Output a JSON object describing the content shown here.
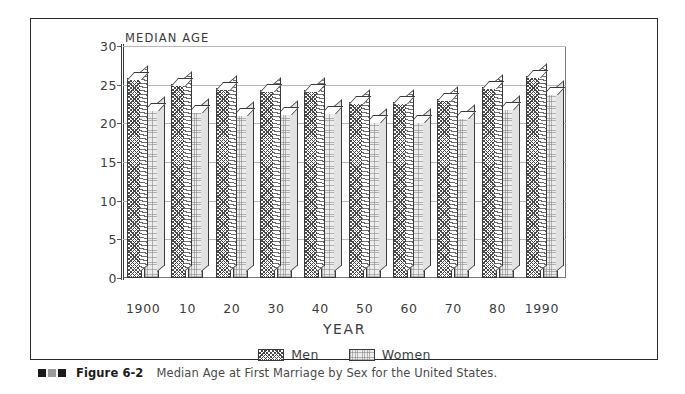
{
  "figure": {
    "caption_marks": [
      "dark",
      "gray",
      "dark"
    ],
    "caption_number": "Figure 6-2",
    "caption_text": "Median Age at First Marriage by Sex for the United States."
  },
  "chart_data": {
    "type": "bar",
    "title": "",
    "ylabel": "MEDIAN AGE",
    "xlabel": "YEAR",
    "categories": [
      "1900",
      "10",
      "20",
      "30",
      "40",
      "50",
      "60",
      "70",
      "80",
      "1990"
    ],
    "series": [
      {
        "name": "Men",
        "values": [
          25.9,
          25.1,
          24.6,
          24.3,
          24.3,
          22.8,
          22.8,
          23.2,
          24.7,
          26.1
        ]
      },
      {
        "name": "Women",
        "values": [
          21.9,
          21.6,
          21.2,
          21.3,
          21.5,
          20.3,
          20.3,
          20.8,
          22.0,
          23.9
        ]
      }
    ],
    "ylim": [
      0,
      30
    ],
    "yticks": [
      0,
      5,
      10,
      15,
      20,
      25,
      30
    ],
    "ytick_labels": [
      "0",
      "5",
      "10",
      "15",
      "20",
      "25",
      "30"
    ],
    "grid": true,
    "legend_position": "bottom-center",
    "legend": [
      "Men",
      "Women"
    ],
    "style_3d": true,
    "series_fill": {
      "Men": "dark-crosshatch",
      "Women": "light-stipple"
    }
  },
  "colors": {
    "frame": "#2b2b2b",
    "plot_frame": "#777777",
    "gridline": "#b9b9b9",
    "text": "#3d3d3d",
    "men_fill": "#4a4a4a",
    "women_fill": "#ececec"
  }
}
